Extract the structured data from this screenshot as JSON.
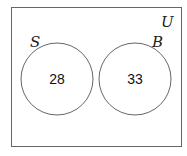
{
  "diagram": {
    "type": "venn",
    "universe_label": "U",
    "sets": [
      {
        "label": "S",
        "value": "28"
      },
      {
        "label": "B",
        "value": "33"
      }
    ],
    "overlap": false
  }
}
